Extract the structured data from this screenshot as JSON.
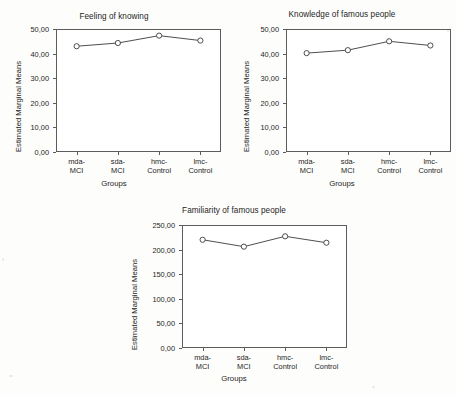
{
  "figure": {
    "background_color": "#fdfdfc",
    "axis_color": "#5c5c5c",
    "line_color": "#3a3a3a",
    "marker_color": "#3a3a3a"
  },
  "chart_data": [
    {
      "id": "feeling-of-knowing",
      "type": "line",
      "title": "Feeling of knowing",
      "xlabel": "Groups",
      "ylabel": "Estimated Marginal Means",
      "categories": [
        "mda-\nMCI",
        "sda-\nMCI",
        "hmc-\nControl",
        "lmc-\nControl"
      ],
      "category_lines": [
        [
          "mda-",
          "MCI"
        ],
        [
          "sda-",
          "MCI"
        ],
        [
          "hmc-",
          "Control"
        ],
        [
          "lmc-",
          "Control"
        ]
      ],
      "values": [
        43.0,
        44.3,
        47.3,
        45.3
      ],
      "ylim": [
        0,
        50
      ],
      "yticks": [
        0,
        10,
        20,
        30,
        40,
        50
      ],
      "ytick_labels": [
        "0,00",
        "10,00",
        "20,00",
        "30,00",
        "40,00",
        "50,00"
      ],
      "grid": false,
      "legend": "none",
      "marker": "circle-open"
    },
    {
      "id": "knowledge-of-famous-people",
      "type": "line",
      "title": "Knowledge of famous people",
      "xlabel": "Groups",
      "ylabel": "Estimated Marginal Means",
      "categories": [
        "mda-\nMCI",
        "sda-\nMCI",
        "hmc-\nControl",
        "lmc-\nControl"
      ],
      "category_lines": [
        [
          "mda-",
          "MCI"
        ],
        [
          "sda-",
          "MCI"
        ],
        [
          "hmc-",
          "Control"
        ],
        [
          "lmc-",
          "Control"
        ]
      ],
      "values": [
        40.2,
        41.4,
        45.0,
        43.3
      ],
      "ylim": [
        0,
        50
      ],
      "yticks": [
        0,
        10,
        20,
        30,
        40,
        50
      ],
      "ytick_labels": [
        "0,00",
        "10,00",
        "20,00",
        "30,00",
        "40,00",
        "50,00"
      ],
      "grid": false,
      "legend": "none",
      "marker": "circle-open"
    },
    {
      "id": "familiarity-of-famous-people",
      "type": "line",
      "title": "Familiarity of famous people",
      "xlabel": "Groups",
      "ylabel": "Estimated Marginal Means",
      "categories": [
        "mda-\nMCI",
        "sda-\nMCI",
        "hmc-\nControl",
        "lmc-\nControl"
      ],
      "category_lines": [
        [
          "mda-",
          "MCI"
        ],
        [
          "sda-",
          "MCI"
        ],
        [
          "hmc-",
          "Control"
        ],
        [
          "lmc-",
          "Control"
        ]
      ],
      "values": [
        220.0,
        206.0,
        227.0,
        214.0
      ],
      "ylim": [
        0,
        250
      ],
      "yticks": [
        0,
        50,
        100,
        150,
        200,
        250
      ],
      "ytick_labels": [
        "0,00",
        "50,00",
        "100,00",
        "150,00",
        "200,00",
        "250,00"
      ],
      "grid": false,
      "legend": "none",
      "marker": "circle-open"
    }
  ]
}
